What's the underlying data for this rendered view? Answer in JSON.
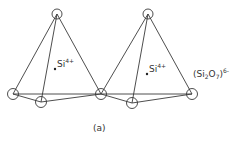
{
  "diagram": {
    "caption": "(a)",
    "formula": {
      "open": "(Si",
      "sub2": "2",
      "o": "O",
      "sub7": "7",
      "close": ")",
      "charge": "6-"
    },
    "cations": [
      {
        "symbol": "Si",
        "charge": "4+"
      },
      {
        "symbol": "Si",
        "charge": "4+"
      }
    ],
    "structure": "two corner-sharing SiO4 tetrahedra (pyrosilicate)"
  }
}
